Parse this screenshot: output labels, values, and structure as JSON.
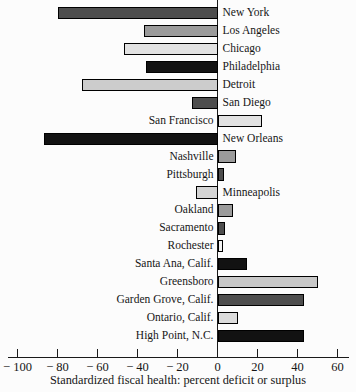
{
  "chart_data": {
    "type": "bar",
    "orientation": "horizontal",
    "title": "",
    "xlabel": "Standardized fiscal health: percent deficit or surplus",
    "ylabel": "",
    "xlim": [
      -110,
      65
    ],
    "grid": false,
    "legend": "none",
    "unit": "percent",
    "categories": [
      "New York",
      "Los Angeles",
      "Chicago",
      "Philadelphia",
      "Detroit",
      "San Diego",
      "San Francisco",
      "New Orleans",
      "Nashville",
      "Pittsburgh",
      "Minneapolis",
      "Oakland",
      "Sacramento",
      "Rochester",
      "Santa Ana, Calif.",
      "Greensboro",
      "Garden Grove, Calif.",
      "Ontario, Calif.",
      "High Point, N.C."
    ],
    "values": [
      -80,
      -37,
      -47,
      -36,
      -68,
      -13,
      22,
      -87,
      9,
      3,
      -11,
      7.5,
      3.5,
      2.5,
      14.5,
      50,
      43,
      10,
      43
    ],
    "bar_colors": [
      "#4e4e4e",
      "#9b9b9b",
      "#e2e2e2",
      "#121212",
      "#cccccc",
      "#4e4e4e",
      "#e2e2e2",
      "#121212",
      "#9b9b9b",
      "#4e4e4e",
      "#d4d4d4",
      "#9b9b9b",
      "#4e4e4e",
      "#f3f3f3",
      "#121212",
      "#c8c8c8",
      "#4e4e4e",
      "#dcdcdc",
      "#121212"
    ],
    "bar_outline_color": "#000000",
    "axis_color": "#1a1a1a",
    "label_placement": "opposite side of zero line from bar",
    "x_ticks": [
      {
        "value": -100,
        "label": "− 100"
      },
      {
        "value": -80,
        "label": "− 80"
      },
      {
        "value": -60,
        "label": "− 60"
      },
      {
        "value": -40,
        "label": "− 40"
      },
      {
        "value": -20,
        "label": "− 20"
      },
      {
        "value": 0,
        "label": "0"
      },
      {
        "value": 20,
        "label": "20"
      },
      {
        "value": 40,
        "label": "40"
      },
      {
        "value": 60,
        "label": "60"
      }
    ]
  }
}
